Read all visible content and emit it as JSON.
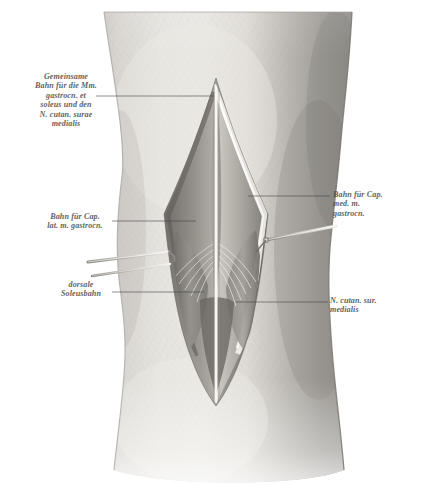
{
  "figure": {
    "kind": "anatomical-illustration",
    "medium": "grayscale halftone engraving",
    "palette": {
      "paper": "#ffffff",
      "skin_light": "#dedcd7",
      "skin_mid": "#c9c6c0",
      "skin_shadow": "#8e8b86",
      "wound_dark": "#6f6c68",
      "wound_deep": "#4e4b48",
      "fascia_highlight": "#f2f0ea",
      "instrument": "#b9b6b0",
      "leader_line": "#4a4a48",
      "label_text": "#4a4a48"
    }
  },
  "labels": {
    "common_path": {
      "text": "Gemeinsame\nBahn für die Mm.\ngastrocn. et\nsoleus und den\nN. cutan. surae\nmedialis",
      "side": "left"
    },
    "lateral_gastroc": {
      "text": "Bahn für Cap.\nlat. m. gastrocn.",
      "side": "left"
    },
    "dorsal_soleus": {
      "text": "dorsale\nSoleusbahn",
      "side": "left"
    },
    "medial_gastroc": {
      "text": "Bahn für Cap.\nmed. m.\ngastrocn.",
      "side": "right"
    },
    "n_cutaneus": {
      "text": "N. cutan. sur.\nmedialis",
      "side": "right"
    }
  }
}
